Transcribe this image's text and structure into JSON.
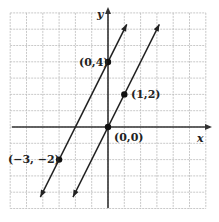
{
  "chart_data": {
    "type": "line",
    "title": "",
    "xlabel": "x",
    "ylabel": "y",
    "xlim": [
      -6,
      6
    ],
    "ylim": [
      -5,
      7
    ],
    "grid": true,
    "legend": null,
    "series": [
      {
        "name": "line through (0,4) and (-3,-2)",
        "equation": "y = 2x + 4",
        "points": [
          {
            "x": 0,
            "y": 4,
            "label": "(0,4)"
          },
          {
            "x": -3,
            "y": -2,
            "label": "(−3, −2)"
          }
        ],
        "slope": 2,
        "intercept": 4
      },
      {
        "name": "line through (0,0) and (1,2)",
        "equation": "y = 2x",
        "points": [
          {
            "x": 0,
            "y": 0,
            "label": "(0,0)"
          },
          {
            "x": 1,
            "y": 2,
            "label": "(1,2)"
          }
        ],
        "slope": 2,
        "intercept": 0
      }
    ]
  },
  "labels": {
    "x_axis": "x",
    "y_axis": "y",
    "p04": "(0,4)",
    "p12": "(1,2)",
    "p00": "(0,0)",
    "pm3m2": "(−3, −2)"
  },
  "colors": {
    "grid": "#bbbbbb",
    "axis": "#333333",
    "line": "#222222"
  }
}
